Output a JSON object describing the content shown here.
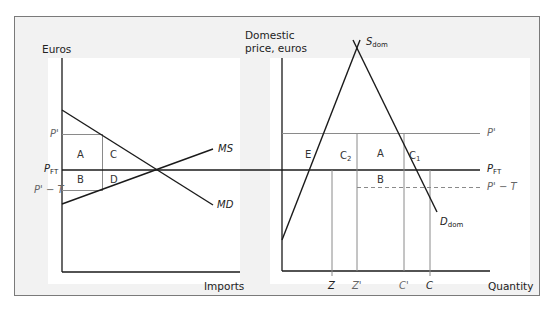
{
  "left_panel": {
    "y_axis_label": "Euros",
    "x_axis_label": "Imports",
    "curves": {
      "demand": "MD",
      "supply": "MS"
    },
    "price_levels": {
      "p_prime": "P'",
      "p_ft_main": "P",
      "p_ft_sub": "FT",
      "p_prime_minus_t": "P' − T"
    },
    "areas": [
      "A",
      "B",
      "C",
      "D"
    ]
  },
  "right_panel": {
    "y_axis_label_line1": "Domestic",
    "y_axis_label_line2": "price, euros",
    "x_axis_label": "Quantity",
    "curves": {
      "supply_main": "S",
      "supply_sub": "dom",
      "demand_main": "D",
      "demand_sub": "dom"
    },
    "price_levels": {
      "p_prime": "P'",
      "p_ft_main": "P",
      "p_ft_sub": "FT",
      "p_prime_minus_t": "P' − T"
    },
    "quantity_ticks": [
      "Z",
      "Z'",
      "C'",
      "C"
    ],
    "areas": {
      "e": "E",
      "c2_main": "C",
      "c2_sub": "2",
      "a": "A",
      "c1_main": "C",
      "c1_sub": "1",
      "b": "B"
    }
  },
  "colors": {
    "frame_bg": "#f2f2f2",
    "frame_border": "#7a7a7a",
    "curve": "#1a1a1a",
    "guide": "#8a8a8a"
  }
}
